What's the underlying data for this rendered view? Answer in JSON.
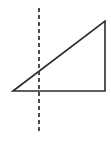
{
  "figure": {
    "title": "Right triangle with vertical dashed line",
    "background_color": "#ffffff",
    "canvas": {
      "width": 111,
      "height": 144
    },
    "stroke_color": "#2b2b2b",
    "dash_color": "#3a3a3a",
    "stroke_width": 1.6,
    "dash_width": 1.8,
    "dash_pattern": "4 3",
    "shapes": {
      "triangle": {
        "name": "right-triangle",
        "vertices": [
          {
            "label": "bottom-left",
            "x": 13,
            "y": 91
          },
          {
            "label": "top-right",
            "x": 105,
            "y": 21
          },
          {
            "label": "bottom-right",
            "x": 105,
            "y": 91
          }
        ],
        "fill": "none"
      },
      "dashed_line": {
        "name": "vertical-dashed-line",
        "x": 39,
        "y_start": 8,
        "y_end": 132
      }
    }
  }
}
